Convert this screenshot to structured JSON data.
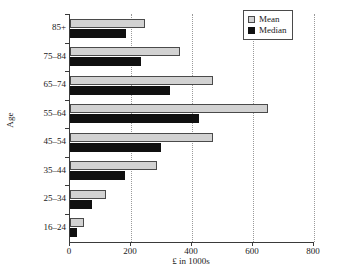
{
  "chart_data": {
    "type": "bar",
    "orientation": "horizontal",
    "title": "",
    "xlabel": "£ in 1000s",
    "ylabel": "Age",
    "categories": [
      "16–24",
      "25–34",
      "35–44",
      "45–54",
      "55–64",
      "65–74",
      "75–84",
      "85+"
    ],
    "series": [
      {
        "name": "Mean",
        "color": "#d2d2d2",
        "values": [
          46,
          118,
          285,
          469,
          649,
          469,
          360,
          246
        ]
      },
      {
        "name": "Median",
        "color": "#101010",
        "values": [
          23,
          72,
          180,
          298,
          423,
          328,
          233,
          184
        ]
      }
    ],
    "xlim": [
      0,
      800
    ],
    "xticks": [
      0,
      200,
      400,
      600,
      800
    ],
    "xtick_labels": [
      "0",
      "200",
      "400",
      "600",
      "800"
    ],
    "grid": "x-dotted",
    "legend_position": "top-right",
    "legend_entries": [
      "Mean",
      "Median"
    ]
  },
  "axes": {
    "y_title": "Age",
    "x_title": "£ in 1000s"
  },
  "legend": {
    "items": [
      {
        "label": "Mean",
        "swatch": "mean-swatch"
      },
      {
        "label": "Median",
        "swatch": "median-swatch"
      }
    ]
  }
}
